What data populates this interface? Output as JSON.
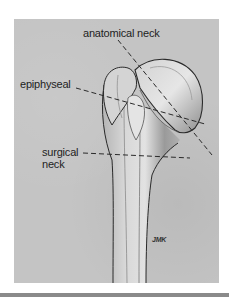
{
  "figure": {
    "labels": {
      "anatomical_neck": "anatomical neck",
      "epiphyseal": "epiphyseal",
      "surgical_neck_line1": "surgical",
      "surgical_neck_line2": "neck"
    },
    "signature": "JMK",
    "colors": {
      "background": "#ffffff",
      "panel": "#c4c4c4",
      "bone_light": "#dcdcdc",
      "bone_shadow": "#7a7a7a",
      "outline": "#2a2a2a",
      "text": "#1e1e1e"
    }
  }
}
